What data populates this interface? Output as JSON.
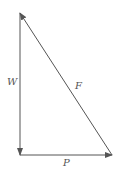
{
  "diagram": {
    "type": "vector-triangle",
    "color": "#555555",
    "vectors": [
      {
        "name": "W",
        "label": "W",
        "direction": "down"
      },
      {
        "name": "P",
        "label": "P",
        "direction": "right"
      },
      {
        "name": "F",
        "label": "F",
        "direction": "up-left"
      }
    ]
  }
}
